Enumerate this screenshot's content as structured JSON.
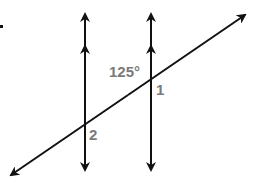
{
  "diagram": {
    "type": "parallel-lines-cut-by-transversal",
    "colors": {
      "line": "#111111",
      "label": "#7a7a7a",
      "background": "#ffffff"
    },
    "parallel_lines": [
      {
        "id": "left-parallel-line",
        "x": 85,
        "y_top": 12,
        "y_bottom": 172,
        "parallel_marker": "double-arrow"
      },
      {
        "id": "right-parallel-line",
        "x": 151,
        "y_top": 12,
        "y_bottom": 172,
        "parallel_marker": "double-arrow"
      }
    ],
    "transversal": {
      "x1": 10,
      "y1": 176,
      "x2": 246,
      "y2": 14
    },
    "labels": {
      "angle_given": "125°",
      "angle_1": "1",
      "angle_2": "2"
    }
  }
}
